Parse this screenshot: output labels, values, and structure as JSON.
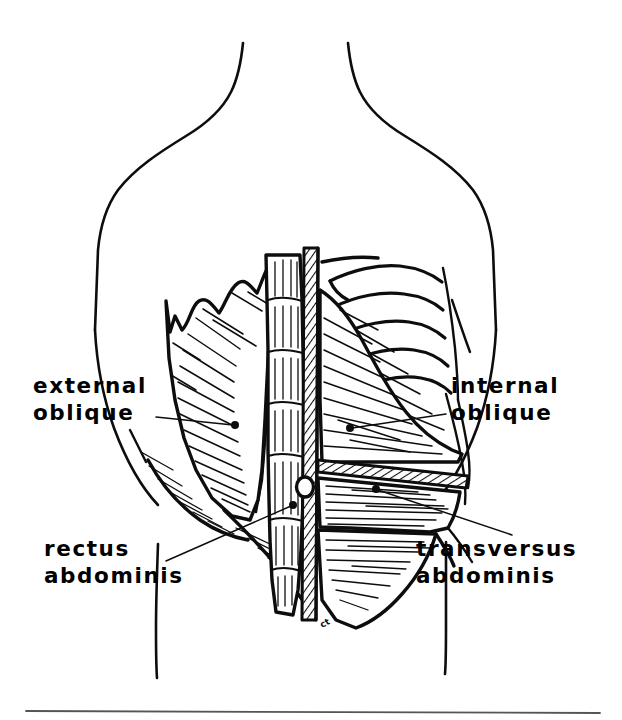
{
  "figure": {
    "kind": "anatomical-line-drawing",
    "view": "front view of human torso from neck to hips",
    "style": "black ink line art on white background",
    "background_color": "#ffffff",
    "ink_color": "#0d0d0d"
  },
  "labels": [
    {
      "id": "external-oblique",
      "line1": "external",
      "line2": "oblique",
      "text_x": 33,
      "text_y": 393,
      "line2_y": 420,
      "align": "start",
      "leader": {
        "x1": 156,
        "y1": 417,
        "x2": 233,
        "y2": 425
      },
      "dot": {
        "cx": 235,
        "cy": 425,
        "r": 4.0
      }
    },
    {
      "id": "internal-oblique",
      "line1": "internal",
      "line2": "oblique",
      "text_x": 451,
      "text_y": 393,
      "line2_y": 420,
      "align": "start",
      "leader": {
        "x1": 446,
        "y1": 414,
        "x2": 352,
        "y2": 428
      },
      "dot": {
        "cx": 350,
        "cy": 428,
        "r": 4.0
      }
    },
    {
      "id": "rectus-abdominis",
      "line1": "rectus",
      "line2": "abdominis",
      "text_x": 44,
      "text_y": 556,
      "line2_y": 583,
      "align": "start",
      "leader": {
        "x1": 166,
        "y1": 561,
        "x2": 291,
        "y2": 506
      },
      "dot": {
        "cx": 293,
        "cy": 505,
        "r": 4.0
      }
    },
    {
      "id": "transversus-abdominis",
      "line1": "transversus",
      "line2": "abdominis",
      "text_x": 416,
      "text_y": 556,
      "line2_y": 583,
      "align": "start",
      "leader": {
        "x1": 512,
        "y1": 535,
        "x2": 378,
        "y2": 490
      },
      "dot": {
        "cx": 376,
        "cy": 489,
        "r": 4.0
      }
    }
  ],
  "annotations": {
    "artifact_mark": "ct"
  },
  "structures": [
    {
      "id": "torso-outline",
      "name": "torso and shoulders outline"
    },
    {
      "id": "linea-alba",
      "name": "linea alba hatched midline strip"
    },
    {
      "id": "umbilicus",
      "name": "umbilicus (navel)"
    },
    {
      "id": "rectus-abdominis-muscle",
      "name": "rectus abdominis with tendinous intersections"
    },
    {
      "id": "external-oblique-muscle",
      "name": "external oblique with serrated superior border"
    },
    {
      "id": "internal-oblique-muscle",
      "name": "internal oblique fan fibers"
    },
    {
      "id": "transversus-abdominis-muscle",
      "name": "transversus abdominis horizontal fibers"
    },
    {
      "id": "ribcage",
      "name": "lower rib cage, right side"
    },
    {
      "id": "aponeurosis-band",
      "name": "hatched aponeurosis band"
    },
    {
      "id": "bottom-rule",
      "name": "page bottom horizontal rule"
    }
  ]
}
